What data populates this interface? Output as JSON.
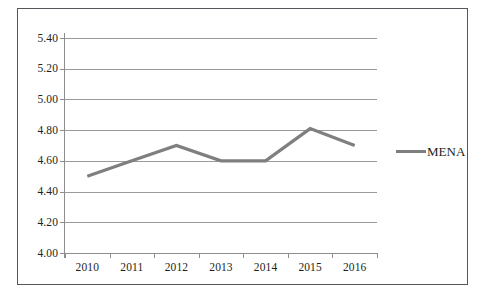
{
  "chart_data": {
    "type": "line",
    "title": "",
    "subtitle": "",
    "xlabel": "",
    "ylabel": "",
    "categories": [
      "2010",
      "2011",
      "2012",
      "2013",
      "2014",
      "2015",
      "2016"
    ],
    "series": [
      {
        "name": "MENA",
        "color": "#7f7f7f",
        "values": [
          4.5,
          4.6,
          4.7,
          4.6,
          4.6,
          4.81,
          4.7
        ]
      }
    ],
    "ylim": [
      4.0,
      5.4
    ],
    "ytick_step": 0.2,
    "ytick_labels": [
      "4.00",
      "4.20",
      "4.40",
      "4.60",
      "4.80",
      "5.00",
      "5.20",
      "5.40"
    ],
    "ytick_values": [
      4.0,
      4.2,
      4.4,
      4.6,
      4.8,
      5.0,
      5.2,
      5.4
    ],
    "grid": {
      "horizontal": true,
      "vertical": false,
      "color": "#9a9a9a"
    },
    "legend": {
      "position": "right",
      "entries": [
        {
          "label": "MENA",
          "color": "#7f7f7f",
          "marker": "line-swatch"
        }
      ]
    },
    "axis_color": "#8d8d8d",
    "frame_color": "#54565b",
    "background": "#ffffff",
    "text_color": "#231f20"
  }
}
